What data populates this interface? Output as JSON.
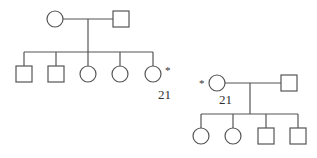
{
  "pedigree_1": {
    "parents": [
      {
        "sex": "female",
        "shape": "circle"
      },
      {
        "sex": "male",
        "shape": "square"
      }
    ],
    "children": [
      {
        "sex": "male",
        "shape": "square"
      },
      {
        "sex": "male",
        "shape": "square"
      },
      {
        "sex": "female",
        "shape": "circle"
      },
      {
        "sex": "female",
        "shape": "circle"
      },
      {
        "sex": "female",
        "shape": "circle",
        "marker": "*",
        "label": "21"
      }
    ]
  },
  "pedigree_2": {
    "parents": [
      {
        "sex": "female",
        "shape": "circle",
        "marker": "*",
        "label": "21"
      },
      {
        "sex": "male",
        "shape": "square"
      }
    ],
    "children": [
      {
        "sex": "female",
        "shape": "circle"
      },
      {
        "sex": "female",
        "shape": "circle"
      },
      {
        "sex": "male",
        "shape": "square"
      },
      {
        "sex": "male",
        "shape": "square"
      }
    ]
  },
  "annotations": {
    "star": "*",
    "label_a": "21",
    "label_b": "21"
  }
}
